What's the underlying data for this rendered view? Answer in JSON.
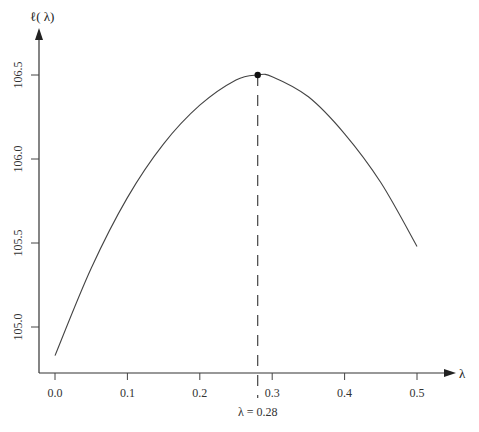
{
  "chart_data": {
    "type": "line",
    "title": "",
    "xlabel": "λ",
    "ylabel": "ℓ( λ)",
    "xlim": [
      0.0,
      0.5
    ],
    "ylim": [
      104.83,
      106.5
    ],
    "x_ticks": [
      "0.0",
      "0.1",
      "0.2",
      "0.3",
      "0.4",
      "0.5"
    ],
    "y_ticks": [
      "105.0",
      "105.5",
      "106.0",
      "106.5"
    ],
    "grid": false,
    "x": [
      0.0,
      0.05,
      0.1,
      0.15,
      0.2,
      0.25,
      0.28,
      0.3,
      0.35,
      0.4,
      0.45,
      0.5
    ],
    "series": [
      {
        "name": "ℓ(λ)",
        "values": [
          104.83,
          105.35,
          105.77,
          106.09,
          106.32,
          106.47,
          106.5,
          106.49,
          106.37,
          106.15,
          105.86,
          105.48
        ]
      }
    ],
    "annotations": [
      {
        "type": "point",
        "x": 0.28,
        "y": 106.5,
        "label": "maximum"
      },
      {
        "type": "vline-dashed",
        "x": 0.28,
        "label": "λ = 0.28"
      }
    ]
  },
  "labels": {
    "y_axis": "ℓ( λ)",
    "x_axis": "λ",
    "max_annotation": "λ = 0.28"
  }
}
